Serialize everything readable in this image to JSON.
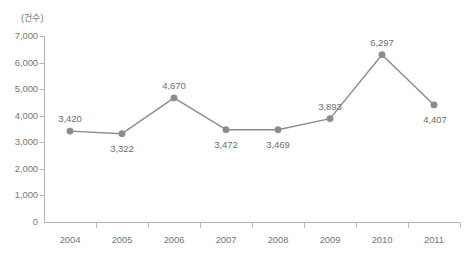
{
  "chart_data": {
    "type": "line",
    "title": "",
    "subtitle": "",
    "unit_label": "(건수)",
    "xlabel": "",
    "ylabel": "",
    "categories": [
      "2004",
      "2005",
      "2006",
      "2007",
      "2008",
      "2009",
      "2010",
      "2011"
    ],
    "values": [
      3420,
      3322,
      4670,
      3472,
      3469,
      3893,
      6297,
      4407
    ],
    "point_labels": [
      "3,420",
      "3,322",
      "4,670",
      "3,472",
      "3,469",
      "3,893",
      "6,297",
      "4,407"
    ],
    "label_positions": [
      "above",
      "below",
      "above",
      "below",
      "below",
      "above",
      "above",
      "below-right"
    ],
    "ylim": [
      0,
      7000
    ],
    "ytick_values": [
      7000,
      6000,
      5000,
      4000,
      3000,
      2000,
      1000,
      0
    ],
    "ytick_labels": [
      "7,000",
      "6,000",
      "5,000",
      "4,000",
      "3,000",
      "2,000",
      "1,000",
      "0"
    ],
    "grid": false,
    "legend": null,
    "series_color": "#8c8c8c",
    "marker_color": "#8c8c8c",
    "axis_color": "#b5b5b5",
    "text_color": "#77787b",
    "background_color": "#ffffff"
  }
}
